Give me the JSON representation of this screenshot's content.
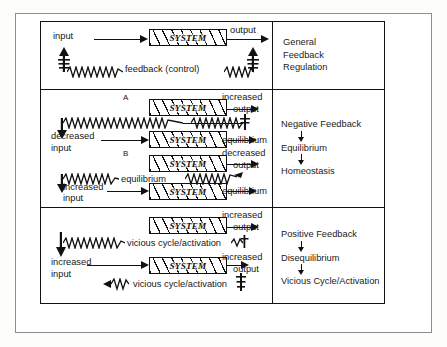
{
  "figure": {
    "system_label": "SYSTEM",
    "colors": {
      "ink": "#111111",
      "frame": "#8d8d8d",
      "paper": "#ffffff"
    }
  },
  "panels": [
    {
      "id": "general",
      "sublabels": [],
      "rows": [
        {
          "id": "general-main",
          "input": "input",
          "system": "SYSTEM",
          "output": "output",
          "feedback": "feedback (control)"
        }
      ],
      "side_labels": [
        "General",
        "Feedback",
        "Regulation"
      ],
      "side_arrows": false
    },
    {
      "id": "negative",
      "sublabels": [
        "A",
        "B"
      ],
      "rows": [
        {
          "id": "neg-a-top",
          "sublabel": "A",
          "system": "SYSTEM",
          "output": "increased output",
          "output_line1": "increased",
          "output_line2": "output",
          "feedback": ""
        },
        {
          "id": "neg-a-bottom",
          "input": "decreased input",
          "input_line1": "decreased",
          "input_line2": "input",
          "system": "SYSTEM",
          "output": "equilibrium"
        },
        {
          "id": "neg-b-top",
          "sublabel": "B",
          "system": "SYSTEM",
          "output": "decreased output",
          "output_line1": "decreased",
          "output_line2": "output",
          "feedback": "equilibrium"
        },
        {
          "id": "neg-b-bottom",
          "input": "increased input",
          "input_line1": "increased",
          "input_line2": "input",
          "system": "SYSTEM",
          "output": "equilibrium"
        }
      ],
      "side_labels": [
        "Negative Feedback",
        "Equilibrium",
        "Homeostasis"
      ],
      "side_arrows": true
    },
    {
      "id": "positive",
      "sublabels": [],
      "rows": [
        {
          "id": "pos-top",
          "system": "SYSTEM",
          "output": "increased output",
          "output_line1": "increased",
          "output_line2": "output",
          "feedback": "vicious cycle/activation"
        },
        {
          "id": "pos-bottom",
          "input": "increased input",
          "input_line1": "increased",
          "input_line2": "input",
          "system": "SYSTEM",
          "output": "increased output",
          "output_line1": "increased",
          "output_line2": "output",
          "feedback": "vicious cycle/activation"
        }
      ],
      "side_labels": [
        "Positive Feedback",
        "Disequilibrium",
        "Vicious Cycle/Activation"
      ],
      "side_arrows": true
    }
  ]
}
